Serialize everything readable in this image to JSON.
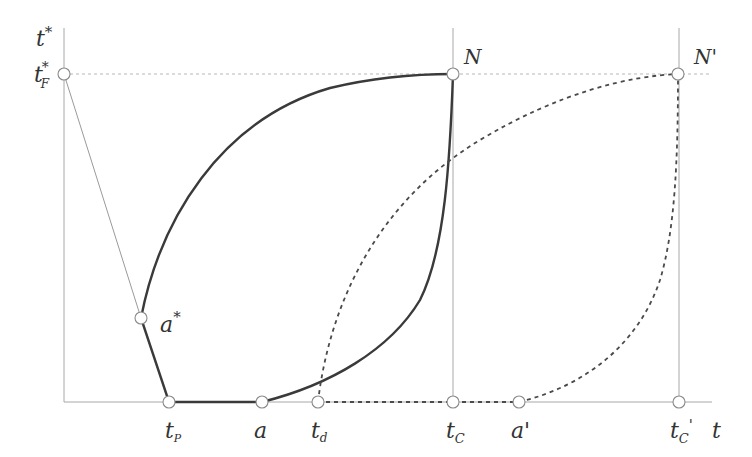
{
  "diagram": {
    "axes": {
      "y_label": "t",
      "y_label_sup": "*",
      "x_label": "t"
    },
    "points": {
      "tF": {
        "label": "t",
        "sub": "F",
        "sup": "*"
      },
      "N": {
        "label": "N"
      },
      "N_prime": {
        "label": "N'"
      },
      "a_star": {
        "label": "a",
        "sup": "*"
      },
      "tP": {
        "label": "t",
        "sub": "P"
      },
      "a": {
        "label": "a"
      },
      "td": {
        "label": "t",
        "sub": "d"
      },
      "tC": {
        "label": "t",
        "sub": "C"
      },
      "a_prime": {
        "label": "a'"
      },
      "tC_prime": {
        "label": "t",
        "sub": "C",
        "prime": "'"
      }
    },
    "colors": {
      "solid_curve": "#3a3a3a",
      "dashed_curve": "#4a4a4a",
      "axis": "#a8a8a8",
      "guide": "#b8b8b8"
    }
  }
}
